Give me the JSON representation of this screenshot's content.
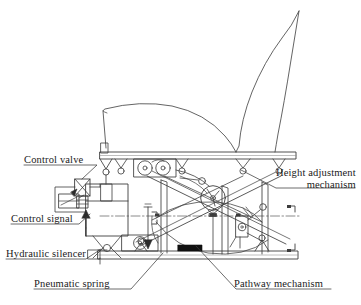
{
  "figure": {
    "type": "engineering-schematic",
    "background_color": "#ffffff",
    "line_color": "#3c3c3c",
    "text_color": "#1a1a1a"
  },
  "labels": {
    "control_valve": "Control valve",
    "control_signal": "Control signal",
    "hydraulic_silencer": "Hydraulic silencer",
    "pneumatic_spring": "Pneumatic spring",
    "height_adjustment_line1": "Height adjustment",
    "height_adjustment_line2": "mechanism",
    "pathway_mechanism": "Pathway mechanism"
  },
  "components": {
    "seat_cushion": "seat-cushion-outline",
    "seat_backrest": "seat-backrest-outline",
    "upper_rail": "upper-mounting-rail",
    "lower_rail": "base-mounting-rail",
    "scissor_arms": "scissor-linkage-arms",
    "roller_pair": "twin-roller-carriage",
    "pivot_circle": "central-pivot-wheel",
    "pneumatic_cylinder": "pneumatic-spring-cylinder",
    "valve_block": "control-valve-block",
    "reservoir": "fluid-reservoir",
    "silencer": "hydraulic-silencer-unit",
    "damper": "pathway-damper",
    "centerline": "horizontal-centre-line",
    "black_block": "solid-stop-block"
  }
}
